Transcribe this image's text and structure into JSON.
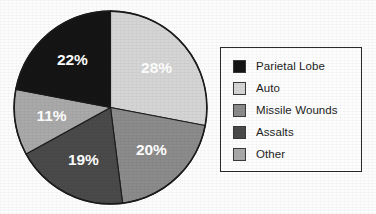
{
  "chart_data": {
    "type": "pie",
    "title": "",
    "labels": [
      "Parietal Lobe",
      "Auto",
      "Missile Wounds",
      "Assalts",
      "Other"
    ],
    "values": [
      22,
      28,
      20,
      19,
      11
    ],
    "value_labels": [
      "22%",
      "28%",
      "20%",
      "19%",
      "11%"
    ],
    "units": "percent",
    "colors": [
      "#151515",
      "#d5d5d5",
      "#8b8b8b",
      "#4a4a4a",
      "#a9a9a9"
    ],
    "start_angle_deg": 0,
    "direction": "clockwise",
    "legend_position": "right",
    "grid": false,
    "slice_label_color": "#ffffff",
    "slices": [
      {
        "label": "Auto",
        "value": 28,
        "value_label": "28%",
        "color": "#d5d5d5",
        "order": 1
      },
      {
        "label": "Missile Wounds",
        "value": 20,
        "value_label": "20%",
        "color": "#8b8b8b",
        "order": 2
      },
      {
        "label": "Assalts",
        "value": 19,
        "value_label": "19%",
        "color": "#4a4a4a",
        "order": 3
      },
      {
        "label": "Other",
        "value": 11,
        "value_label": "11%",
        "color": "#a9a9a9",
        "order": 4
      },
      {
        "label": "Parietal Lobe",
        "value": 22,
        "value_label": "22%",
        "color": "#151515",
        "order": 5
      }
    ]
  },
  "legend": {
    "items": [
      {
        "label": "Parietal Lobe",
        "color": "#151515"
      },
      {
        "label": "Auto",
        "color": "#d5d5d5"
      },
      {
        "label": "Missile Wounds",
        "color": "#8b8b8b"
      },
      {
        "label": "Assalts",
        "color": "#4a4a4a"
      },
      {
        "label": "Other",
        "color": "#a9a9a9"
      }
    ]
  }
}
